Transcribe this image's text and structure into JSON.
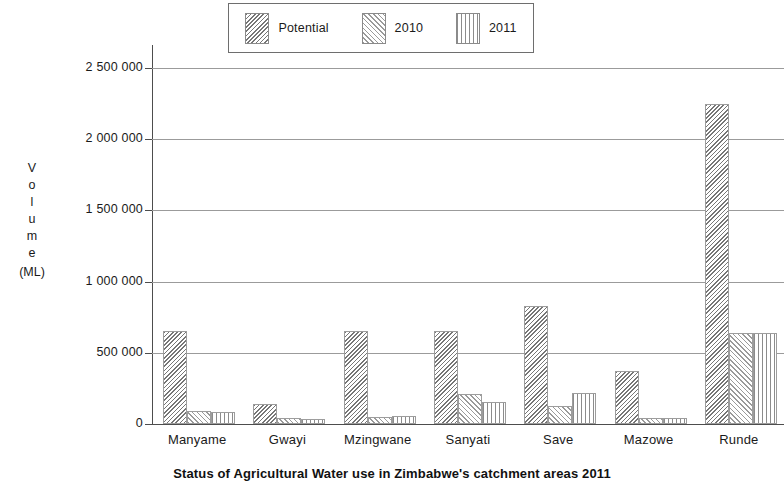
{
  "chart_data": {
    "type": "bar",
    "title": "Status of Agricultural Water use in Zimbabwe's catchment areas 2011",
    "xlabel": "",
    "ylabel": "Volume (ML)",
    "ylabel_stacked": [
      "V",
      "o",
      "l",
      "u",
      "m",
      "e"
    ],
    "ylabel_unit": "(ML)",
    "categories": [
      "Manyame",
      "Gwayi",
      "Mzingwane",
      "Sanyati",
      "Save",
      "Mazowe",
      "Runde"
    ],
    "series": [
      {
        "name": "Potential",
        "pattern": "diagonal-hatch-dense",
        "values": [
          650000,
          140000,
          650000,
          650000,
          830000,
          370000,
          2250000
        ]
      },
      {
        "name": "2010",
        "pattern": "diagonal-hatch-light",
        "values": [
          90000,
          40000,
          50000,
          210000,
          125000,
          40000,
          640000
        ]
      },
      {
        "name": "2011",
        "pattern": "vertical-lines",
        "values": [
          85000,
          35000,
          55000,
          155000,
          215000,
          40000,
          640000
        ]
      }
    ],
    "ylim": [
      0,
      2600000
    ],
    "yticks": [
      0,
      500000,
      1000000,
      1500000,
      2000000,
      2500000
    ],
    "ytick_labels": [
      "0",
      "500 000",
      "1 000 000",
      "1 500 000",
      "2 000 000",
      "2 500 000"
    ],
    "grid": true,
    "legend_position": "top-center",
    "legend_entries": [
      "Potential",
      "2010",
      "2011"
    ]
  }
}
